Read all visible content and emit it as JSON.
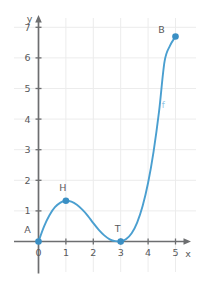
{
  "chart_data": {
    "type": "line",
    "title": "",
    "subtitle": "",
    "xlabel": "x",
    "ylabel": "y",
    "xlim": [
      0,
      5.6
    ],
    "ylim": [
      0,
      7.4
    ],
    "grid": true,
    "legend": null,
    "curve_label": "f",
    "x_ticks": [
      "0",
      "1",
      "2",
      "3",
      "4",
      "5"
    ],
    "x_tick_values": [
      0,
      1,
      2,
      3,
      4,
      5
    ],
    "y_ticks": [
      "1",
      "2",
      "3",
      "4",
      "5",
      "6",
      "7"
    ],
    "y_tick_values": [
      1,
      2,
      3,
      4,
      5,
      6,
      7
    ],
    "series": [
      {
        "name": "f",
        "color": "#4a9fd0",
        "x": [
          0.0,
          0.2,
          0.4,
          0.6,
          0.8,
          1.0,
          1.2,
          1.4,
          1.6,
          1.8,
          2.0,
          2.2,
          2.4,
          2.6,
          2.8,
          3.0,
          3.2,
          3.4,
          3.6,
          3.8,
          4.0,
          4.2,
          4.4,
          4.6,
          4.8,
          5.0
        ],
        "y": [
          0.0,
          0.49,
          0.86,
          1.12,
          1.27,
          1.33,
          1.3,
          1.2,
          1.04,
          0.84,
          0.6,
          0.38,
          0.2,
          0.07,
          0.01,
          0.0,
          0.08,
          0.27,
          0.62,
          1.16,
          1.92,
          2.94,
          4.25,
          5.88,
          6.4,
          6.7
        ]
      }
    ],
    "points": [
      {
        "label": "A",
        "x": 0.0,
        "y": 0.0,
        "label_dx": -11,
        "label_dy": -9,
        "color": "#3a8fc4"
      },
      {
        "label": "H",
        "x": 1.0,
        "y": 1.33,
        "label_dx": -3,
        "label_dy": -10,
        "color": "#3a8fc4"
      },
      {
        "label": "T",
        "x": 3.0,
        "y": 0.0,
        "label_dx": -3,
        "label_dy": -10,
        "color": "#3a8fc4"
      },
      {
        "label": "B",
        "x": 5.0,
        "y": 6.7,
        "label_dx": -14,
        "label_dy": -3,
        "color": "#3a8fc4"
      }
    ],
    "colors": {
      "curve": "#4a9fd0",
      "point": "#3a8fc4",
      "grid": "#ececec",
      "axis": "#6d6e70",
      "text": "#58595b",
      "fn_label": "#8fc6e6",
      "background": "#ffffff"
    }
  }
}
